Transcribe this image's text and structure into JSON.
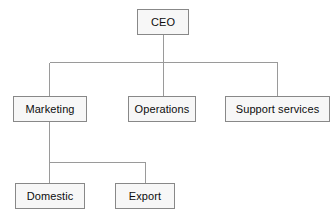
{
  "diagram": {
    "type": "organization-chart",
    "background_color": "#ffffff",
    "node_style": {
      "fill": "#f7f7f7",
      "border_color": "#888888",
      "text_color": "#0d0d0d"
    },
    "connector_style": {
      "color": "#9a9a9a",
      "width": 1
    },
    "nodes": [
      {
        "id": "ceo",
        "label": "CEO",
        "level": 0
      },
      {
        "id": "marketing",
        "label": "Marketing",
        "level": 1
      },
      {
        "id": "operations",
        "label": "Operations",
        "level": 1
      },
      {
        "id": "support_services",
        "label": "Support services",
        "level": 1
      },
      {
        "id": "domestic",
        "label": "Domestic",
        "level": 2
      },
      {
        "id": "export",
        "label": "Export",
        "level": 2
      }
    ],
    "edges": [
      {
        "from": "ceo",
        "to": "marketing"
      },
      {
        "from": "ceo",
        "to": "operations"
      },
      {
        "from": "ceo",
        "to": "support_services"
      },
      {
        "from": "marketing",
        "to": "domestic"
      },
      {
        "from": "marketing",
        "to": "export"
      }
    ]
  }
}
